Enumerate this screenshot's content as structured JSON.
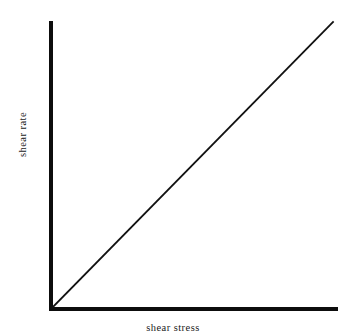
{
  "figure": {
    "background_color": "#ffffff",
    "ink_color": "#0d0d0d",
    "width": 346,
    "height": 336
  },
  "axes": {
    "x_title": "shear stress",
    "y_title": "shear rate",
    "x_axis_name": "horizontal-axis-line",
    "y_axis_name": "vertical-axis-line"
  },
  "chart_data": {
    "type": "line",
    "title": "",
    "subtitle": "",
    "xlabel": "shear stress",
    "ylabel": "shear rate",
    "xlim": [
      0,
      1
    ],
    "ylim": [
      0,
      1
    ],
    "grid": false,
    "legend": false,
    "legend_position": "none",
    "axis_style": "L-shaped spines, no ticks, no tick labels",
    "annotations": [],
    "series": [
      {
        "name": "Newtonian fluid",
        "x": [
          0,
          1
        ],
        "y": [
          0,
          1
        ],
        "color": "#111111",
        "linewidth": 1.8,
        "description": "straight line of constant slope through the origin"
      }
    ]
  }
}
